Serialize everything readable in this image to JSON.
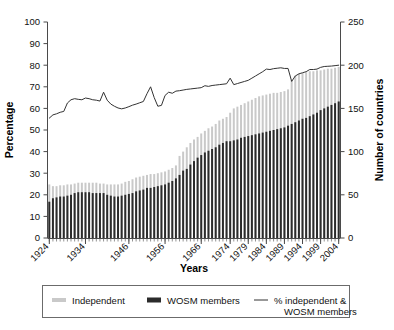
{
  "chart_data": {
    "type": "bar",
    "title": "",
    "subtitle": "",
    "xlabel": "Years",
    "ylabel": "Percentage",
    "y2label": "Number of countries",
    "ylim": [
      0,
      100
    ],
    "y2lim": [
      0,
      250
    ],
    "grid": false,
    "legend_position": "bottom",
    "y_ticks": [
      "0",
      "10",
      "20",
      "30",
      "40",
      "50",
      "60",
      "70",
      "80",
      "90",
      "100"
    ],
    "y2_ticks": [
      "0",
      "50",
      "100",
      "150",
      "200",
      "250"
    ],
    "x_tick_labels": [
      "1924",
      "1934",
      "1946",
      "1956",
      "1966",
      "1974",
      "1979",
      "1984",
      "1989",
      "1994",
      "1999",
      "2004"
    ],
    "x_tick_years": [
      1924,
      1934,
      1946,
      1956,
      1966,
      1974,
      1979,
      1984,
      1989,
      1994,
      1999,
      2004
    ],
    "x": [
      1924,
      1925,
      1926,
      1927,
      1928,
      1929,
      1930,
      1931,
      1932,
      1933,
      1934,
      1935,
      1936,
      1937,
      1938,
      1939,
      1940,
      1941,
      1942,
      1943,
      1944,
      1945,
      1946,
      1947,
      1948,
      1949,
      1950,
      1951,
      1952,
      1953,
      1954,
      1955,
      1956,
      1957,
      1958,
      1959,
      1960,
      1961,
      1962,
      1963,
      1964,
      1965,
      1966,
      1967,
      1968,
      1969,
      1970,
      1971,
      1972,
      1973,
      1974,
      1975,
      1976,
      1977,
      1978,
      1979,
      1980,
      1981,
      1982,
      1983,
      1984,
      1985,
      1986,
      1987,
      1988,
      1989,
      1990,
      1991,
      1992,
      1993,
      1994,
      1995,
      1996,
      1997,
      1998,
      1999,
      2000,
      2001,
      2002,
      2003,
      2004
    ],
    "series": [
      {
        "name": "Independent",
        "unit": "Number of countries",
        "axis": "right",
        "color": "#c9c9c9",
        "values": [
          62,
          60,
          60,
          61,
          61,
          62,
          62,
          63,
          64,
          64,
          64,
          64,
          64,
          64,
          63,
          63,
          62,
          62,
          62,
          62,
          63,
          65,
          66,
          68,
          70,
          71,
          72,
          73,
          74,
          74,
          75,
          76,
          77,
          79,
          81,
          84,
          95,
          100,
          105,
          110,
          114,
          117,
          121,
          124,
          127,
          129,
          132,
          136,
          138,
          140,
          145,
          150,
          152,
          154,
          156,
          158,
          160,
          162,
          164,
          165,
          166,
          167,
          168,
          168,
          169,
          170,
          172,
          183,
          188,
          190,
          191,
          192,
          193,
          193,
          194,
          194,
          195,
          196,
          196,
          197,
          198
        ]
      },
      {
        "name": "WOSM members",
        "unit": "Number of countries",
        "axis": "right",
        "color": "#2b2b2b",
        "values": [
          42,
          46,
          47,
          48,
          48,
          49,
          50,
          52,
          53,
          53,
          53,
          53,
          52,
          52,
          52,
          52,
          50,
          49,
          48,
          48,
          49,
          50,
          51,
          52,
          54,
          55,
          56,
          58,
          58,
          59,
          60,
          61,
          62,
          64,
          66,
          69,
          73,
          78,
          80,
          85,
          89,
          93,
          96,
          99,
          101,
          103,
          105,
          108,
          110,
          112,
          112,
          113,
          114,
          116,
          117,
          118,
          119,
          120,
          121,
          122,
          123,
          124,
          125,
          126,
          127,
          128,
          130,
          132,
          134,
          136,
          138,
          139,
          141,
          143,
          145,
          148,
          150,
          152,
          154,
          156,
          158
        ]
      },
      {
        "name": "% independent & WOSM members",
        "unit": "Percentage",
        "axis": "left",
        "color": "#333333",
        "values": [
          55.5,
          57.0,
          57.5,
          58.2,
          58.6,
          62.5,
          64.0,
          64.5,
          64.2,
          64.0,
          64.8,
          64.5,
          64.0,
          63.8,
          63.4,
          67.5,
          63.8,
          62.0,
          61.0,
          60.2,
          59.8,
          60.2,
          60.8,
          61.5,
          62.0,
          62.6,
          63.2,
          66.8,
          70.0,
          65.0,
          61.0,
          61.4,
          66.0,
          67.5,
          67.0,
          68.0,
          68.2,
          68.5,
          68.8,
          69.0,
          69.2,
          69.4,
          69.6,
          70.5,
          70.2,
          70.6,
          70.8,
          71.0,
          71.2,
          71.4,
          74.0,
          71.0,
          71.5,
          72.0,
          72.5,
          73.0,
          74.0,
          75.0,
          76.0,
          77.0,
          78.2,
          78.0,
          78.4,
          78.6,
          78.8,
          78.5,
          78.5,
          72.5,
          75.0,
          76.0,
          76.5,
          77.0,
          78.0,
          78.0,
          78.2,
          79.0,
          79.4,
          79.5,
          79.6,
          79.8,
          80.0
        ]
      }
    ],
    "legend": [
      {
        "label": "Independent",
        "marker": "bar",
        "color": "#c9c9c9"
      },
      {
        "label": "WOSM members",
        "marker": "bar",
        "color": "#2b2b2b"
      },
      {
        "label": "% independent & WOSM members",
        "marker": "line",
        "color": "#333333"
      }
    ]
  }
}
